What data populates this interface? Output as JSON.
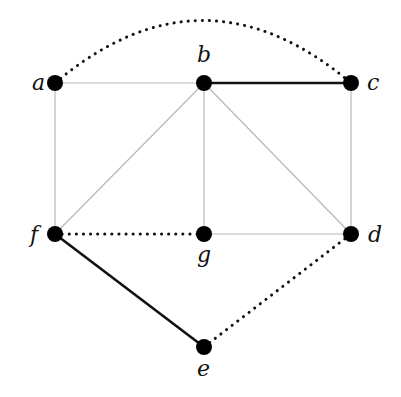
{
  "graph": {
    "nodes": [
      {
        "id": "a",
        "label": "a",
        "x": 55,
        "y": 83,
        "lx": 32,
        "ly": 90
      },
      {
        "id": "b",
        "label": "b",
        "x": 204,
        "y": 83,
        "lx": 197,
        "ly": 62
      },
      {
        "id": "c",
        "label": "c",
        "x": 351,
        "y": 83,
        "lx": 367,
        "ly": 90
      },
      {
        "id": "d",
        "label": "d",
        "x": 351,
        "y": 234,
        "lx": 368,
        "ly": 242
      },
      {
        "id": "e",
        "label": "e",
        "x": 204,
        "y": 347,
        "lx": 197,
        "ly": 376
      },
      {
        "id": "f",
        "label": "f",
        "x": 55,
        "y": 234,
        "lx": 30,
        "ly": 242
      },
      {
        "id": "g",
        "label": "g",
        "x": 204,
        "y": 234,
        "lx": 197,
        "ly": 262
      }
    ],
    "edges": [
      {
        "from": "a",
        "to": "b",
        "style": "thin"
      },
      {
        "from": "a",
        "to": "f",
        "style": "thin"
      },
      {
        "from": "b",
        "to": "f",
        "style": "thin"
      },
      {
        "from": "b",
        "to": "g",
        "style": "thin"
      },
      {
        "from": "b",
        "to": "d",
        "style": "thin"
      },
      {
        "from": "c",
        "to": "d",
        "style": "thin"
      },
      {
        "from": "g",
        "to": "d",
        "style": "thin"
      },
      {
        "from": "b",
        "to": "c",
        "style": "bold"
      },
      {
        "from": "f",
        "to": "e",
        "style": "bold"
      },
      {
        "from": "f",
        "to": "g",
        "style": "dotted"
      },
      {
        "from": "e",
        "to": "d",
        "style": "dotted"
      },
      {
        "from": "a",
        "to": "c",
        "style": "dotted-arc"
      }
    ]
  },
  "colors": {
    "thin": "#b8b8b8",
    "bold": "#111111",
    "dotted": "#111111",
    "node": "#000000"
  }
}
